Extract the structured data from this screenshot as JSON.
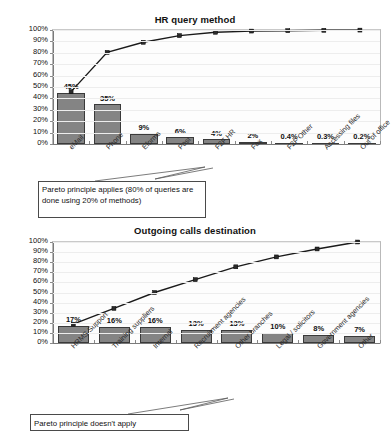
{
  "chart_data": [
    {
      "type": "bar",
      "title": "HR query method",
      "xlabel": "",
      "ylabel": "",
      "ylim": [
        0,
        100
      ],
      "ytick_labels": [
        "100%",
        "90%",
        "80%",
        "70%",
        "60%",
        "50%",
        "40%",
        "30%",
        "20%",
        "10%",
        "0%"
      ],
      "grid": true,
      "legend": "none",
      "categories": [
        "eMail",
        "Phone",
        "Eforms",
        "Post",
        "F2F HR",
        "Fax",
        "F2F Other",
        "Accessing files",
        "Out of office"
      ],
      "values": [
        45,
        35,
        9,
        6,
        4,
        2,
        0.4,
        0.3,
        0.2
      ],
      "value_labels": [
        "45%",
        "35%",
        "9%",
        "6%",
        "4%",
        "2%",
        "0.4%",
        "0.3%",
        "0.2%"
      ],
      "series": [
        {
          "name": "Frequency",
          "type": "bar",
          "values": [
            45,
            35,
            9,
            6,
            4,
            2,
            0.4,
            0.3,
            0.2
          ]
        },
        {
          "name": "Cumulative %",
          "type": "line",
          "values": [
            45,
            80,
            89,
            95,
            98,
            99,
            99.4,
            99.7,
            99.9
          ]
        }
      ],
      "annotation": "Pareto principle applies (80% of queries are done using 20% of methods)"
    },
    {
      "type": "bar",
      "title": "Outgoing calls destination",
      "xlabel": "",
      "ylabel": "",
      "ylim": [
        0,
        100
      ],
      "ytick_labels": [
        "100%",
        "90%",
        "80%",
        "70%",
        "60%",
        "50%",
        "40%",
        "30%",
        "20%",
        "10%",
        "0%"
      ],
      "grid": true,
      "legend": "none",
      "categories": [
        "HRMS Support",
        "Training suppliers",
        "Internal",
        "Recruitment agencies",
        "Other branches",
        "Legal / solicitors",
        "Government agencies",
        "Other"
      ],
      "values": [
        17,
        16,
        16,
        13,
        13,
        10,
        8,
        7
      ],
      "value_labels": [
        "17%",
        "16%",
        "16%",
        "13%",
        "13%",
        "10%",
        "8%",
        "7%"
      ],
      "series": [
        {
          "name": "Frequency",
          "type": "bar",
          "values": [
            17,
            16,
            16,
            13,
            13,
            10,
            8,
            7
          ]
        },
        {
          "name": "Cumulative %",
          "type": "line",
          "values": [
            17,
            33,
            49,
            62,
            75,
            85,
            93,
            100
          ]
        }
      ],
      "annotation": "Pareto principle doesn't apply"
    }
  ],
  "colors": {
    "bar_fill": "#848484",
    "bar_border": "#3a3a3a",
    "line": "#1a1a1a",
    "grid": "#ededed",
    "plot_background": "#fdfdfd",
    "axis": "#7a7a7a",
    "text": "#111111"
  }
}
